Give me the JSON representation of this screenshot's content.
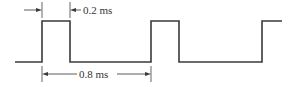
{
  "diagram": {
    "type": "pulse-waveform",
    "colors": {
      "line": "#3a3a3a",
      "background": "#ffffff"
    },
    "waveform": {
      "baseline_y": 62,
      "high_y": 21,
      "start_x": 15,
      "pulses": [
        {
          "rise_x": 42,
          "fall_x": 70
        },
        {
          "rise_x": 151,
          "fall_x": 179
        },
        {
          "rise_x": 262,
          "fall_x": null,
          "end_x": 282
        }
      ]
    },
    "annotations": {
      "pulse_width": {
        "label": "0.2 ms",
        "from_x": 42,
        "to_x": 70,
        "y": 10,
        "label_x": 82
      },
      "period": {
        "label": "0.8 ms",
        "from_x": 42,
        "to_x": 151,
        "y": 74,
        "label_x": 78
      }
    }
  }
}
